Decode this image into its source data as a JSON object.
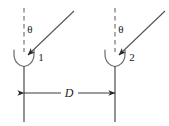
{
  "figure": {
    "type": "physics-diagram",
    "background_color": "#ffffff",
    "line_color": "#3a3a3a",
    "text_color": "#1a1a1a"
  },
  "labels": {
    "angle_left": "θ",
    "angle_right": "θ",
    "slit_one": "1",
    "slit_two": "2",
    "separation": "D"
  },
  "elements": {
    "barrier_left_name": "barrier-line-left",
    "barrier_right_name": "barrier-line-right",
    "normal_left_name": "dashed-normal-left",
    "normal_right_name": "dashed-normal-right",
    "ray_left_name": "incident-ray-left",
    "ray_right_name": "incident-ray-right",
    "slit_left_name": "slit-curve-one",
    "slit_right_name": "slit-curve-two",
    "dimension_name": "separation-dimension-line"
  },
  "geometry": {
    "left_axis_x": 24,
    "right_axis_x": 115,
    "dashed_top_y": 8,
    "dashed_bottom_y": 52,
    "slit_y": 57,
    "barrier_bottom_y": 122,
    "dimension_y": 93
  }
}
